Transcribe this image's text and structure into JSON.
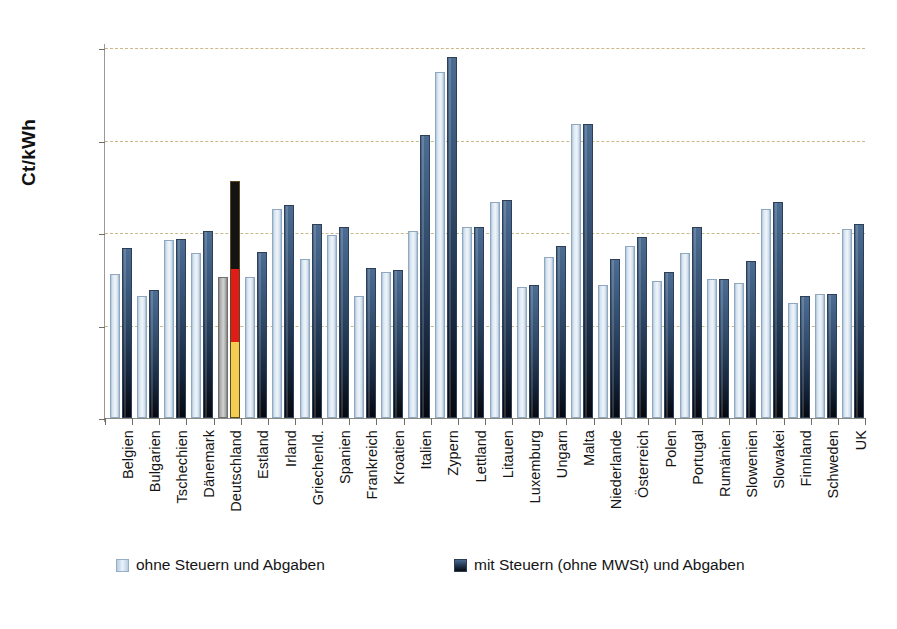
{
  "chart_data": {
    "type": "bar",
    "title": "",
    "xlabel": "",
    "ylabel": "Ct/kWh",
    "ylim": [
      0,
      20
    ],
    "yticks": [
      0,
      5,
      10,
      15,
      20
    ],
    "grid": true,
    "legend_position": "bottom",
    "categories": [
      "Belgien",
      "Bulgarien",
      "Tschechien",
      "Dänemark",
      "Deutschland",
      "Estland",
      "Irland",
      "Griechenld.",
      "Spanien",
      "Frankreich",
      "Kroatien",
      "Italien",
      "Zypern",
      "Lettland",
      "Litauen",
      "Luxemburg",
      "Ungarn",
      "Malta",
      "Niederlande",
      "Österreich",
      "Polen",
      "Portugal",
      "Rumänien",
      "Slowenien",
      "Slowakei",
      "Finnland",
      "Schweden",
      "UK"
    ],
    "series": [
      {
        "name": "ohne Steuern und Abgaben",
        "color": "#dbe7f2",
        "values": [
          7.8,
          6.6,
          9.6,
          8.9,
          7.6,
          7.6,
          11.3,
          8.6,
          9.9,
          6.6,
          7.9,
          10.1,
          18.7,
          10.3,
          11.7,
          7.1,
          8.7,
          15.9,
          7.2,
          9.3,
          7.4,
          8.9,
          7.5,
          7.3,
          11.3,
          6.2,
          6.7,
          10.2
        ]
      },
      {
        "name": "mit Steuern (ohne MWSt) und Abgaben",
        "color": "#23364f",
        "values": [
          9.2,
          6.9,
          9.7,
          10.1,
          12.8,
          9.0,
          11.5,
          10.5,
          10.3,
          8.1,
          8.0,
          15.3,
          19.5,
          10.3,
          11.8,
          7.2,
          9.3,
          15.9,
          8.6,
          9.8,
          7.9,
          10.3,
          7.5,
          8.5,
          11.7,
          6.6,
          6.7,
          10.5
        ]
      }
    ],
    "highlight": {
      "category": "Deutschland",
      "style": "german-flag-colors",
      "colors": [
        "#141414",
        "#e01b18",
        "#f2cd52"
      ]
    }
  },
  "legend": {
    "items": [
      {
        "label": "ohne Steuern und Abgaben",
        "swatch": "light-blue-swatch"
      },
      {
        "label": "mit Steuern (ohne MWSt) und Abgaben",
        "swatch": "dark-navy-swatch"
      }
    ]
  },
  "caption": {
    "text": ""
  }
}
